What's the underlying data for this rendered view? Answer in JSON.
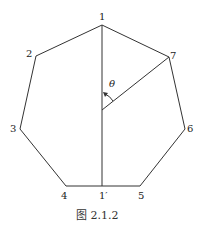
{
  "figure": {
    "caption": "图 2.1.2",
    "angle_label": "θ",
    "vertices": [
      {
        "label": "1",
        "x": 102,
        "y": 25
      },
      {
        "label": "2",
        "x": 36,
        "y": 56
      },
      {
        "label": "3",
        "x": 20,
        "y": 129
      },
      {
        "label": "4",
        "x": 66,
        "y": 186
      },
      {
        "label": "5",
        "x": 140,
        "y": 186
      },
      {
        "label": "6",
        "x": 185,
        "y": 129
      },
      {
        "label": "7",
        "x": 169,
        "y": 57
      }
    ],
    "interior_points": [
      {
        "label": "1′",
        "x": 102,
        "y": 186
      }
    ],
    "stroke_color": "#333333"
  }
}
